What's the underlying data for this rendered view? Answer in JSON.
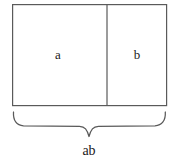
{
  "figure": {
    "type": "area-model-diagram",
    "background_color": "#ffffff",
    "stroke_color": "#5a5a5a",
    "text_color": "#1a1a1a",
    "outer_rectangle": {
      "x": 12,
      "y": 4,
      "width": 155,
      "height": 102,
      "stroke_width": 1.2
    },
    "divider": {
      "orientation": "vertical",
      "x": 107,
      "y_top": 4,
      "y_bottom": 106,
      "stroke_width": 1.2
    },
    "regions": [
      {
        "name": "left-region",
        "label": "a",
        "label_x": 58,
        "label_y": 55,
        "x": 12,
        "width": 95
      },
      {
        "name": "right-region",
        "label": "b",
        "label_x": 137,
        "label_y": 55,
        "x": 107,
        "width": 60
      }
    ],
    "brace": {
      "orientation": "bottom",
      "x_start": 13,
      "x_end": 166,
      "y_top": 112,
      "y_line": 126,
      "y_tip": 137,
      "center_x": 89,
      "stroke_width": 1.2
    },
    "brace_label": {
      "name": "total-width-label",
      "text": "ab",
      "x": 89,
      "y": 152
    }
  }
}
